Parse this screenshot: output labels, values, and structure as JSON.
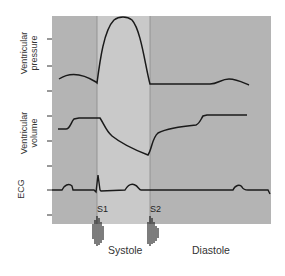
{
  "figure": {
    "y_labels": {
      "pressure_line1": "Ventricular",
      "pressure_line2": "pressure",
      "volume_line1": "Ventricular",
      "volume_line2": "volume",
      "ecg": "ECG"
    },
    "heart_sounds": {
      "s1": "S1",
      "s2": "S2"
    },
    "phases": {
      "systole": "Systole",
      "diastole": "Diastole"
    },
    "colors": {
      "background_panel": "#b4b4b4",
      "systole_band": "#c9c9c9",
      "trace": "#1a1a1a"
    }
  }
}
